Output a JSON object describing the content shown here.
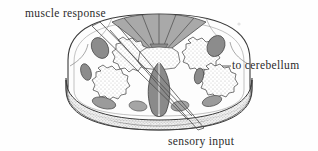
{
  "figure": {
    "kind": "anatomical-illustration",
    "background_color": "#fefefe",
    "ink_color": "#3a3a3a",
    "labels": [
      {
        "id": "muscle-response",
        "text": "muscle response",
        "position": "top-left",
        "leader": "long diagonal line running from the label down and to the right, across the cord, ending at the lower-right cut face"
      },
      {
        "id": "to-cerebellum",
        "text": "to cerebellum",
        "position": "middle-right",
        "leader": "short horizontal dash pointing left to the outer right margin of the cord"
      },
      {
        "id": "sensory-input",
        "text": "sensory input",
        "position": "bottom-center",
        "leader": "long diagonal line running from the label up and to the left, across the cord, ending at the upper-left white matter"
      }
    ],
    "structures": {
      "outline": "rounded cylindrical cord segment, cut transversely, wider than tall",
      "top_wedge": "fan of five radial segments in medium gray at the dorsal midline",
      "gray_matter": "paired stippled butterfly-shaped regions with jagged serrated outlines, left and right of midline",
      "central_cleft": "dark gray lens/teardrop shape at the ventral midline with a vertical fissure",
      "tracts": "dark gray oval blobs scattered in the white matter on both sides",
      "cut_face": "stippled and hatched band along the lower edge showing cylindrical depth",
      "speck": "faint isolated dot in the upper-right blank margin"
    },
    "palette": {
      "paper": "#fefefe",
      "line": "#3a3a3a",
      "wedge_gray": "#a9a9a9",
      "tract_gray": "#8c8c8c",
      "stipple_gray": "#bdbdbd",
      "cleft_gray": "#8a8a8a",
      "cutface_gray": "#d6d6d6",
      "text": "#2b2b2b"
    }
  }
}
